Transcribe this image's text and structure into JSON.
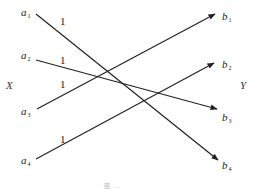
{
  "diagram": {
    "type": "bipartite-graph",
    "left_set": {
      "label": "X"
    },
    "right_set": {
      "label": "Y"
    },
    "left_nodes": [
      {
        "name": "a",
        "sub": "1"
      },
      {
        "name": "a",
        "sub": "2"
      },
      {
        "name": "a",
        "sub": "3"
      },
      {
        "name": "a",
        "sub": "4"
      }
    ],
    "right_nodes": [
      {
        "name": "b",
        "sub": "1"
      },
      {
        "name": "b",
        "sub": "2"
      },
      {
        "name": "b",
        "sub": "3"
      },
      {
        "name": "b",
        "sub": "4"
      }
    ],
    "edges": [
      {
        "from": "a1",
        "to": "b4",
        "weight": "1"
      },
      {
        "from": "a2",
        "to": "b3",
        "weight": "1"
      },
      {
        "from": "a3",
        "to": "b1",
        "weight": "1"
      },
      {
        "from": "a4",
        "to": "b2",
        "weight": "1"
      }
    ],
    "caption": "图 …"
  }
}
